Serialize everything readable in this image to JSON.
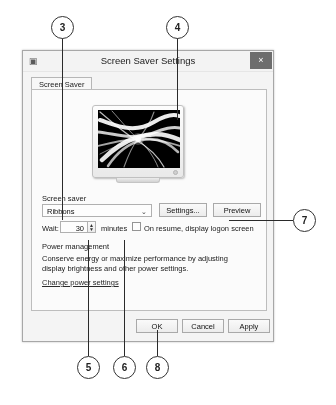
{
  "dialog": {
    "title": "Screen Saver Settings",
    "window_icon": "screen-saver-icon",
    "close_label": "×",
    "tabs": [
      {
        "label": "Screen Saver",
        "selected": true
      }
    ],
    "preview": {
      "monitor_label": "screen-saver-preview-monitor",
      "screensaver_name": "Ribbons"
    },
    "screen_saver_section": {
      "label": "Screen saver",
      "selected_value": "Ribbons",
      "dropdown_arrow": "⌄",
      "settings_button": "Settings...",
      "preview_button": "Preview"
    },
    "wait_row": {
      "label": "Wait:",
      "value": "30",
      "spinner_up": "▲",
      "spinner_down": "▼",
      "units": "minutes",
      "checkbox_label": "On resume, display logon screen",
      "checkbox_checked": false
    },
    "power_management": {
      "heading": "Power management",
      "description": "Conserve energy or maximize performance by adjusting display brightness and other power settings.",
      "link": "Change power settings"
    },
    "footer": {
      "ok": "OK",
      "cancel": "Cancel",
      "apply": "Apply"
    }
  },
  "callouts": [
    {
      "number": "3"
    },
    {
      "number": "4"
    },
    {
      "number": "7"
    },
    {
      "number": "5"
    },
    {
      "number": "6"
    },
    {
      "number": "8"
    }
  ],
  "colors": {
    "dialog_background": "#f4f4f4",
    "tab_page_background": "#fbfbfb",
    "close_button": "#6d6d6d",
    "callout_outline": "#333333",
    "screen_background": "#000000"
  }
}
